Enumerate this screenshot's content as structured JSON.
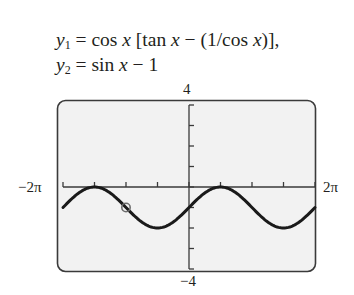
{
  "equations": {
    "y1": {
      "lhs": "y",
      "sub": "1",
      "rhs_parts": [
        " = cos ",
        "x",
        " [tan ",
        "x",
        " − (1/cos ",
        "x",
        ")],"
      ]
    },
    "y2": {
      "lhs": "y",
      "sub": "2",
      "rhs_parts": [
        " = sin ",
        "x",
        " − 1"
      ]
    }
  },
  "window": {
    "xmin_label": "−2π",
    "xmax_label": "2π",
    "ymax_label": "4",
    "ymin_label": "−4"
  },
  "colors": {
    "screen_bg": "#f2f2f2",
    "frame": "#3a3a3a",
    "axis": "#3a3a3a",
    "curve": "#1a1a1a",
    "hole_marker": "#6d6d6d"
  },
  "chart_data": {
    "type": "line",
    "xlabel": "",
    "ylabel": "",
    "xlim": [
      -6.283,
      6.283
    ],
    "ylim": [
      -4,
      4
    ],
    "x_tick_step": "π/2",
    "y_tick_step": 1,
    "x_tick_labels": [
      "−2π",
      "2π"
    ],
    "y_tick_labels": [
      "−4",
      "4"
    ],
    "grid": false,
    "legend": null,
    "series": [
      {
        "name": "y1 = y2 = sin x − 1",
        "function": "sin(x) - 1",
        "x": [
          -6.283,
          -5.498,
          -4.712,
          -3.927,
          -3.142,
          -2.356,
          -1.571,
          -0.785,
          0,
          0.785,
          1.571,
          2.356,
          3.142,
          3.927,
          4.712,
          5.498,
          6.283
        ],
        "values": [
          -1,
          -0.293,
          0,
          -0.293,
          -1,
          -1.707,
          -2,
          -1.707,
          -1,
          -0.293,
          0,
          -0.293,
          -1,
          -1.707,
          -2,
          -1.707,
          -1
        ]
      }
    ],
    "annotations": [
      {
        "type": "open-circle",
        "x": -3.142,
        "y": -1
      }
    ]
  }
}
